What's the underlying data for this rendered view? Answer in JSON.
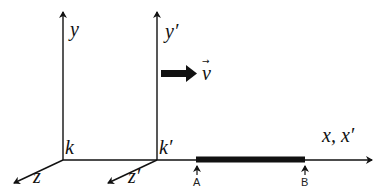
{
  "diagram": {
    "type": "reference-frames",
    "frames": [
      {
        "origin_label": "k",
        "axes": {
          "y": "y",
          "z": "z",
          "x": "x"
        }
      },
      {
        "origin_label": "k′",
        "axes": {
          "y": "y′",
          "z": "z′",
          "x": "x′"
        }
      }
    ],
    "shared_x_axis_label": "x, x′",
    "velocity_label": "v",
    "velocity_vector_symbol": "→",
    "rod": {
      "start_label": "A",
      "end_label": "B"
    },
    "colors": {
      "stroke": "#111111",
      "rod": "#111111",
      "background": "#ffffff"
    }
  }
}
